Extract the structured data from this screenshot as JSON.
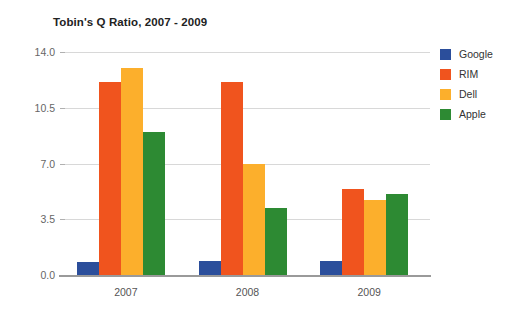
{
  "chart_data": {
    "type": "bar",
    "title": "Tobin's Q Ratio, 2007 - 2009",
    "xlabel": "",
    "ylabel": "",
    "categories": [
      "2007",
      "2008",
      "2009"
    ],
    "ylim": [
      0.0,
      14.0
    ],
    "yticks": [
      "0.0",
      "3.5",
      "7.0",
      "10.5",
      "14.0"
    ],
    "ytick_values": [
      0.0,
      3.5,
      7.0,
      10.5,
      14.0
    ],
    "grid": true,
    "legend_position": "right",
    "series": [
      {
        "name": "Google",
        "color": "#2B4E9B",
        "values": [
          0.8,
          0.9,
          0.9
        ]
      },
      {
        "name": "RIM",
        "color": "#F0541E",
        "values": [
          12.1,
          12.1,
          5.4
        ]
      },
      {
        "name": "Dell",
        "color": "#FCAF2C",
        "values": [
          13.0,
          7.0,
          4.7
        ]
      },
      {
        "name": "Apple",
        "color": "#2D8A33",
        "values": [
          9.0,
          4.2,
          5.1
        ]
      }
    ]
  }
}
